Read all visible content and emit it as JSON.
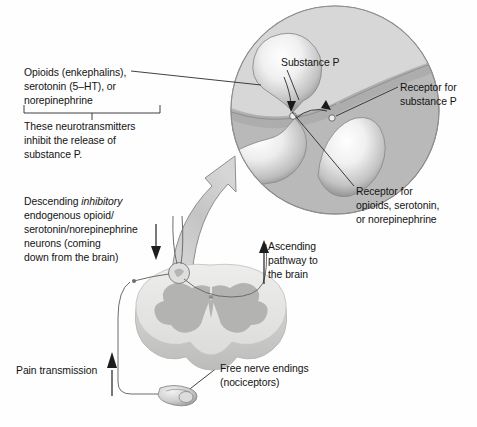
{
  "figure": {
    "type": "anatomical-diagram",
    "background_color": "#fefefe",
    "ink_color": "#131313"
  },
  "labels": {
    "opioids": {
      "lines": [
        "Opioids (enkephalins),",
        "serotonin (5–HT), or",
        "norepinephrine"
      ]
    },
    "inhibit_note": {
      "lines": [
        "These neurotransmitters",
        "inhibit the release of",
        "substance P."
      ]
    },
    "descending": {
      "line1_pre": "Descending ",
      "line1_em": "inhibitory",
      "lines_rest": [
        "endogenous opioid/",
        "serotonin/norepinephrine",
        "neurons (coming",
        "down from the brain)"
      ]
    },
    "pain_transmission": {
      "text": "Pain transmission"
    },
    "substance_p": {
      "text": "Substance P"
    },
    "receptor_substance_p": {
      "lines": [
        "Receptor for",
        "substance P"
      ]
    },
    "receptor_opioids": {
      "lines": [
        "Receptor for",
        "opioids, serotonin,",
        "or norepinephrine"
      ]
    },
    "ascending": {
      "lines": [
        "Ascending",
        "pathway to",
        "the brain"
      ]
    },
    "free_nerve_endings": {
      "lines": [
        "Free nerve endings",
        "(nociceptors)"
      ]
    }
  },
  "colors": {
    "circle_fill": "#b9b9b9",
    "circle_upper_fill": "#d6d6d6",
    "circle_stroke": "#8a8a8a",
    "terminal_light": "#f4f4f4",
    "terminal_mid": "#c9c9c9",
    "terminal_dark": "#9a9a9a",
    "cord_white_matter": "#e3e3e1",
    "cord_gray_matter": "#b4b4b2",
    "cord_edge": "#cfcfcd",
    "arrow_fill": "#c7c7c7",
    "arrow_stroke": "#8e8e8e",
    "line_stroke": "#2b2b2b"
  }
}
